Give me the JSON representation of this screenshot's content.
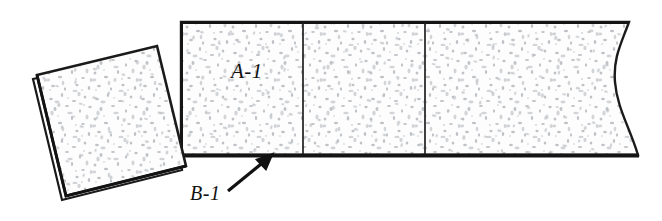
{
  "figure": {
    "background_color": "#ffffff",
    "line_color": "#1a1a1a",
    "fill_color": "#fcfcfc",
    "speckle_color": "#b9bcc0",
    "labels": {
      "slab_label": "A-1",
      "edge_label": "B-1"
    },
    "annotations": [
      {
        "name": "slab-callout",
        "text": "A-1",
        "x": 231,
        "y": 78
      },
      {
        "name": "edge-callout",
        "text": "B-1",
        "x": 190,
        "y": 200
      }
    ],
    "parts": [
      {
        "name": "rotated-tile",
        "kind": "square-tile",
        "rotation_deg": -17,
        "corners": [
          [
            37,
            75
          ],
          [
            157,
            46
          ],
          [
            186,
            166
          ],
          [
            66,
            196
          ]
        ],
        "has_thickness_edge": true
      },
      {
        "name": "long-strip",
        "kind": "panel-run",
        "left": 181,
        "top": 22,
        "bottom": 155,
        "break_line_x": 629,
        "segment_dividers": [
          303,
          425
        ],
        "segment_count": 3,
        "break_line": true
      }
    ],
    "leader_arrow": {
      "name": "b1-leader-arrow",
      "from": [
        226,
        192
      ],
      "to": [
        272,
        155
      ],
      "head": "solid-triangle"
    }
  }
}
